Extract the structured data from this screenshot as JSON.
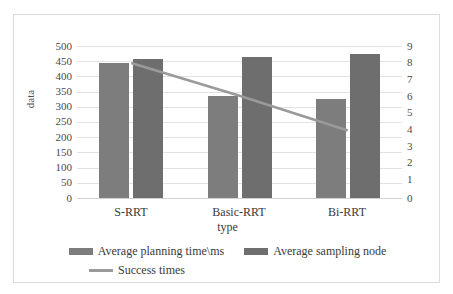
{
  "chart_data": {
    "type": "bar",
    "title": "",
    "subtitle": "",
    "xlabel": "type",
    "ylabel": "data",
    "categories": [
      "S-RRT",
      "Basic-RRT",
      "Bi-RRT"
    ],
    "series": [
      {
        "name": "Average planning time\\ms",
        "type": "bar",
        "axis": "left",
        "color": "#7d7d7d",
        "values": [
          443,
          337,
          327
        ]
      },
      {
        "name": "Average sampling node",
        "type": "bar",
        "axis": "left",
        "color": "#6e6e6e",
        "values": [
          457,
          465,
          475
        ]
      },
      {
        "name": "Success times",
        "type": "line",
        "axis": "right",
        "color": "#9a9a9a",
        "values": [
          8,
          6.05,
          4
        ]
      }
    ],
    "ylim": [
      0,
      500
    ],
    "y2lim": [
      0,
      9
    ],
    "yticks": [
      500,
      450,
      400,
      350,
      300,
      250,
      200,
      150,
      100,
      50,
      0
    ],
    "y2ticks": [
      9,
      8,
      7,
      6,
      5,
      4,
      3,
      2,
      1,
      0
    ],
    "grid": true,
    "legend_position": "bottom"
  },
  "axes": {
    "left_title": "data",
    "bottom_title": "type",
    "left_ticks": [
      "500",
      "450",
      "400",
      "350",
      "300",
      "250",
      "200",
      "150",
      "100",
      "50",
      "0"
    ],
    "right_ticks": [
      "9",
      "8",
      "7",
      "6",
      "5",
      "4",
      "3",
      "2",
      "1",
      "0"
    ],
    "categories": [
      "S-RRT",
      "Basic-RRT",
      "Bi-RRT"
    ]
  },
  "legend": {
    "items": [
      {
        "label": "Average planning time\\ms",
        "marker": "bar-swatch",
        "color": "#7d7d7d"
      },
      {
        "label": "Average sampling node",
        "marker": "bar-swatch",
        "color": "#6e6e6e"
      },
      {
        "label": "Success times",
        "marker": "line-swatch",
        "color": "#9a9a9a"
      }
    ]
  }
}
